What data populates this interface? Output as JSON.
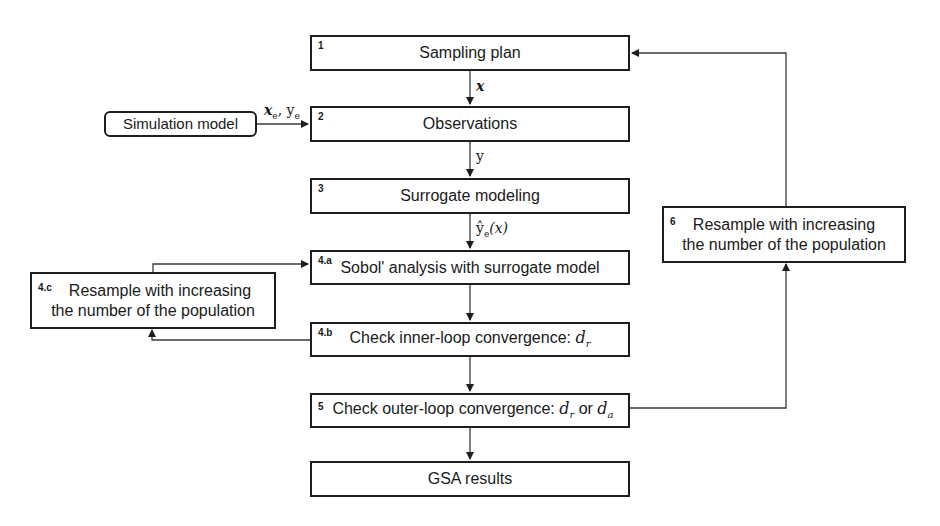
{
  "diagram": {
    "boxes": {
      "b1": {
        "num": "1",
        "label": "Sampling plan"
      },
      "b2": {
        "num": "2",
        "label": "Observations"
      },
      "b3": {
        "num": "3",
        "label": "Surrogate modeling"
      },
      "b4a": {
        "num": "4.a",
        "label": "Sobol' analysis with surrogate model"
      },
      "b4b": {
        "num": "4.b",
        "label": "Check inner-loop convergence: ",
        "math": "d",
        "math_sub": "r"
      },
      "b5": {
        "num": "5",
        "label": "Check outer-loop convergence: ",
        "math1": "d",
        "math1_sub": "r",
        "or": " or ",
        "math2": "d",
        "math2_sub": "a"
      },
      "b4c": {
        "num": "4.c",
        "line1": "Resample with increasing",
        "line2": "the number of the population"
      },
      "b6": {
        "num": "6",
        "line1": "Resample with increasing",
        "line2": "the number of the population"
      },
      "gsa": {
        "label": "GSA results"
      },
      "sim": {
        "label": "Simulation model"
      }
    },
    "edge_labels": {
      "x": "x",
      "xe_ye_x": "x",
      "xe_ye_sub1": "e",
      "xe_ye_comma": ", ",
      "xe_ye_y": "y",
      "xe_ye_sub2": "e",
      "y": "y",
      "yhat": "ŷ",
      "yhat_sub": "e",
      "yhat_arg": "(x)"
    },
    "colors": {
      "stroke": "#1e1e1e",
      "wire": "#3a3a3a",
      "background": "#ffffff"
    }
  }
}
